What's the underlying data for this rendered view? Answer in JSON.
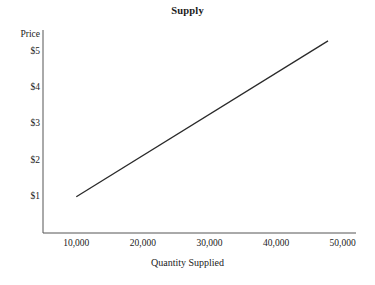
{
  "chart_data": {
    "type": "line",
    "title": "Supply",
    "xlabel": "Quantity Supplied",
    "ylabel": "Price",
    "grid": false,
    "legend": "none",
    "xlim": [
      5000,
      52000
    ],
    "ylim": [
      0,
      5.6
    ],
    "x_tick_labels": [
      "10,000",
      "20,000",
      "30,000",
      "40,000",
      "50,000"
    ],
    "x_tick_values": [
      10000,
      20000,
      30000,
      40000,
      50000
    ],
    "y_tick_labels": [
      "$1",
      "$2",
      "$3",
      "$4",
      "$5"
    ],
    "y_tick_values": [
      1,
      2,
      3,
      4,
      5
    ],
    "series": [
      {
        "name": "Supply",
        "color": "#2a2a2a",
        "x": [
          10000,
          47800
        ],
        "values": [
          1.0,
          5.3
        ],
        "points": [
          {
            "quantity": 10000,
            "price": 1.0
          },
          {
            "quantity": 20000,
            "price": 2.13
          },
          {
            "quantity": 30000,
            "price": 3.27
          },
          {
            "quantity": 40000,
            "price": 4.4
          },
          {
            "quantity": 47800,
            "price": 5.3
          }
        ]
      }
    ]
  },
  "colors": {
    "background": "#ffffff",
    "axis": "#555555",
    "line": "#2a2a2a",
    "text": "#222222"
  }
}
